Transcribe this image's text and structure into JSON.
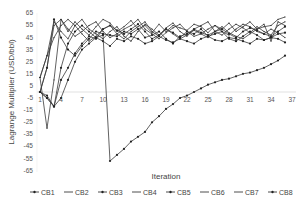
{
  "chart_data": {
    "type": "line",
    "title": "",
    "xlabel": "Iteration",
    "ylabel": "Lagrange Multiplier (USD/bbl)",
    "ylim": [
      -65,
      65
    ],
    "yticks": [
      65,
      55,
      45,
      35,
      25,
      15,
      5,
      -5,
      -15,
      -25,
      -35,
      -45,
      -55,
      -65
    ],
    "xticks": [
      1,
      4,
      7,
      10,
      13,
      16,
      19,
      22,
      25,
      28,
      31,
      34,
      37
    ],
    "xlim": [
      1,
      37
    ],
    "grid": false,
    "legend_position": "bottom",
    "x": [
      1,
      2,
      3,
      4,
      5,
      6,
      7,
      8,
      9,
      10,
      11,
      12,
      13,
      14,
      15,
      16,
      17,
      18,
      19,
      20,
      21,
      22,
      23,
      24,
      25,
      26,
      27,
      28,
      29,
      30,
      31,
      32,
      33,
      34,
      35,
      36
    ],
    "series": [
      {
        "name": "CB1",
        "marker": true,
        "values": [
          0,
          20,
          60,
          45,
          35,
          30,
          38,
          44,
          50,
          48,
          47,
          46,
          50,
          48,
          52,
          45,
          47,
          50,
          44,
          40,
          46,
          48,
          52,
          49,
          47,
          50,
          52,
          48,
          45,
          50,
          53,
          51,
          48,
          46,
          50,
          54
        ]
      },
      {
        "name": "CB2",
        "marker": false,
        "values": [
          12,
          -30,
          10,
          60,
          50,
          58,
          52,
          47,
          54,
          60,
          57,
          50,
          54,
          59,
          52,
          55,
          49,
          56,
          50,
          55,
          53,
          51,
          56,
          54,
          49,
          55,
          52,
          57,
          50,
          54,
          58,
          52,
          54,
          55,
          60,
          62
        ]
      },
      {
        "name": "CB3",
        "marker": true,
        "values": [
          0,
          -5,
          -12,
          10,
          20,
          32,
          40,
          46,
          44,
          52,
          55,
          51,
          48,
          52,
          56,
          50,
          44,
          47,
          52,
          49,
          45,
          50,
          48,
          52,
          46,
          48,
          50,
          44,
          42,
          46,
          50,
          47,
          43,
          45,
          48,
          49
        ]
      },
      {
        "name": "CB4",
        "marker": false,
        "values": [
          12,
          30,
          58,
          50,
          44,
          55,
          60,
          52,
          48,
          44,
          50,
          54,
          46,
          42,
          50,
          56,
          52,
          47,
          53,
          57,
          50,
          46,
          52,
          55,
          58,
          50,
          47,
          52,
          56,
          53,
          49,
          54,
          50,
          47,
          55,
          58
        ]
      },
      {
        "name": "CB5",
        "marker": true,
        "values": [
          0,
          -3,
          -12,
          -5,
          10,
          25,
          35,
          40,
          45,
          42,
          38,
          44,
          42,
          46,
          44,
          40,
          42,
          46,
          43,
          41,
          44,
          42,
          40,
          44,
          46,
          43,
          42,
          45,
          44,
          42,
          40,
          44,
          43,
          45,
          44,
          41
        ]
      },
      {
        "name": "CB6",
        "marker": false,
        "values": [
          0,
          20,
          55,
          60,
          52,
          46,
          50,
          55,
          58,
          50,
          45,
          48,
          52,
          55,
          60,
          52,
          48,
          44,
          49,
          53,
          56,
          50,
          46,
          48,
          52,
          55,
          50,
          47,
          52,
          56,
          54,
          50,
          48,
          52,
          49,
          45
        ]
      },
      {
        "name": "CB7",
        "marker": false,
        "values": [
          12,
          30,
          45,
          55,
          60,
          55,
          48,
          42,
          46,
          52,
          55,
          48,
          44,
          50,
          54,
          58,
          50,
          46,
          52,
          48,
          44,
          47,
          51,
          48,
          45,
          50,
          54,
          49,
          46,
          44,
          48,
          52,
          56,
          42,
          58,
          55
        ]
      },
      {
        "name": "CB8",
        "marker": true,
        "values": [
          0,
          -5,
          -12,
          20,
          40,
          50,
          55,
          50,
          45,
          47,
          -57,
          -52,
          -47,
          -41,
          -37,
          -33,
          -25,
          -20,
          -14,
          -10,
          -5,
          -3,
          0,
          3,
          6,
          8,
          10,
          11,
          13,
          15,
          16,
          18,
          20,
          23,
          26,
          30
        ]
      }
    ]
  },
  "legend": {
    "items": [
      {
        "label": "CB1",
        "marker": true
      },
      {
        "label": "CB2",
        "marker": false
      },
      {
        "label": "CB3",
        "marker": true
      },
      {
        "label": "CB4",
        "marker": false
      },
      {
        "label": "CB5",
        "marker": true
      },
      {
        "label": "CB6",
        "marker": false
      },
      {
        "label": "CB7",
        "marker": false
      },
      {
        "label": "CB8",
        "marker": true
      }
    ]
  },
  "axes": {
    "x_title": "Iteration",
    "y_title": "Lagrange Multiplier (USD/bbl)"
  },
  "colors": {
    "line": "#3a3a3a",
    "marker": "#222222",
    "axis": "#d9d9d9",
    "text": "#555555"
  }
}
